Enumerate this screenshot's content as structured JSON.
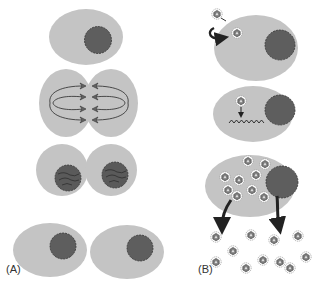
{
  "colors": {
    "cytoplasm": "#c4c4c4",
    "nucleus": "#5e5e5e",
    "nucleus_outline": "#333333",
    "line": "#3a3a3a",
    "virus_fill": "#8a8a8a",
    "background": "#ffffff"
  },
  "panel_a": {
    "label": "(A)",
    "stages": [
      "interphase-cell",
      "dividing-cell-spindle",
      "daughter-cells-condensed",
      "daughter-cells-interphase"
    ]
  },
  "panel_b": {
    "label": "(B)",
    "stages": [
      "virus-entry",
      "viral-genome-integration",
      "viral-replication",
      "virion-release"
    ],
    "released_virion_count": 11,
    "internal_virion_count": 9
  }
}
